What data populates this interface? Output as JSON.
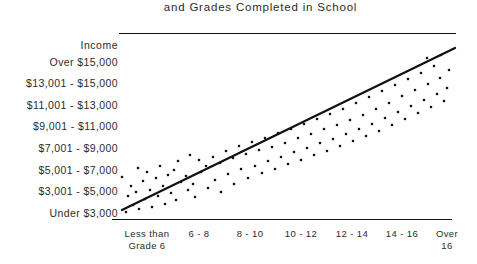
{
  "chart_data": {
    "type": "scatter",
    "title": "and Grades Completed in School",
    "ylabel": "Income",
    "xlabel": "",
    "grid": false,
    "legend": "none",
    "trendline": {
      "label": "regression-line",
      "x_start": 122,
      "y_start": 210,
      "x_end": 455,
      "y_end": 48,
      "direction": "positive"
    },
    "categories": [
      "Less than\nGrade 6",
      "6 - 8",
      "8 - 10",
      "10 - 12",
      "12 - 14",
      "14 - 16",
      "Over\n16"
    ],
    "y_tick_labels": [
      "Over $15,000",
      "$13,001 - $15,000",
      "$11,001 - $13,000",
      "$9,001 - $11,000",
      "$7,001 - $9,000",
      "$5,001 - $7,000",
      "$3,001 - $5,000",
      "Under $3,000"
    ],
    "ylim": [
      0,
      8
    ],
    "xlim": [
      0,
      7
    ],
    "point_count": 92,
    "points": [
      [
        126,
        212
      ],
      [
        133,
        205
      ],
      [
        139,
        209
      ],
      [
        128,
        196
      ],
      [
        136,
        192
      ],
      [
        145,
        199
      ],
      [
        152,
        207
      ],
      [
        131,
        186
      ],
      [
        143,
        181
      ],
      [
        150,
        190
      ],
      [
        122,
        177
      ],
      [
        158,
        196
      ],
      [
        165,
        204
      ],
      [
        147,
        172
      ],
      [
        156,
        178
      ],
      [
        163,
        186
      ],
      [
        171,
        193
      ],
      [
        138,
        168
      ],
      [
        176,
        200
      ],
      [
        168,
        175
      ],
      [
        181,
        182
      ],
      [
        160,
        166
      ],
      [
        188,
        190
      ],
      [
        195,
        197
      ],
      [
        174,
        170
      ],
      [
        186,
        176
      ],
      [
        193,
        184
      ],
      [
        178,
        161
      ],
      [
        201,
        172
      ],
      [
        208,
        188
      ],
      [
        199,
        160
      ],
      [
        215,
        180
      ],
      [
        206,
        166
      ],
      [
        190,
        155
      ],
      [
        221,
        192
      ],
      [
        213,
        157
      ],
      [
        228,
        174
      ],
      [
        220,
        163
      ],
      [
        234,
        184
      ],
      [
        226,
        151
      ],
      [
        241,
        169
      ],
      [
        233,
        158
      ],
      [
        248,
        178
      ],
      [
        239,
        146
      ],
      [
        255,
        166
      ],
      [
        246,
        154
      ],
      [
        262,
        173
      ],
      [
        252,
        142
      ],
      [
        268,
        161
      ],
      [
        259,
        150
      ],
      [
        275,
        169
      ],
      [
        265,
        138
      ],
      [
        281,
        157
      ],
      [
        272,
        147
      ],
      [
        288,
        164
      ],
      [
        278,
        133
      ],
      [
        294,
        152
      ],
      [
        285,
        143
      ],
      [
        301,
        160
      ],
      [
        291,
        129
      ],
      [
        307,
        148
      ],
      [
        298,
        138
      ],
      [
        314,
        155
      ],
      [
        304,
        124
      ],
      [
        320,
        143
      ],
      [
        311,
        134
      ],
      [
        327,
        151
      ],
      [
        317,
        119
      ],
      [
        333,
        139
      ],
      [
        324,
        129
      ],
      [
        340,
        146
      ],
      [
        330,
        114
      ],
      [
        346,
        134
      ],
      [
        337,
        125
      ],
      [
        353,
        141
      ],
      [
        343,
        109
      ],
      [
        359,
        129
      ],
      [
        350,
        120
      ],
      [
        366,
        136
      ],
      [
        356,
        103
      ],
      [
        372,
        124
      ],
      [
        363,
        115
      ],
      [
        379,
        131
      ],
      [
        369,
        97
      ],
      [
        385,
        118
      ],
      [
        376,
        109
      ],
      [
        392,
        125
      ],
      [
        382,
        91
      ],
      [
        398,
        112
      ],
      [
        389,
        103
      ],
      [
        405,
        119
      ],
      [
        395,
        85
      ],
      [
        411,
        106
      ],
      [
        402,
        96
      ],
      [
        418,
        113
      ],
      [
        408,
        79
      ],
      [
        424,
        100
      ],
      [
        415,
        90
      ],
      [
        431,
        107
      ],
      [
        421,
        73
      ],
      [
        437,
        94
      ],
      [
        428,
        84
      ],
      [
        444,
        101
      ],
      [
        434,
        66
      ],
      [
        440,
        78
      ],
      [
        447,
        88
      ],
      [
        427,
        58
      ],
      [
        441,
        55
      ],
      [
        449,
        70
      ]
    ]
  }
}
